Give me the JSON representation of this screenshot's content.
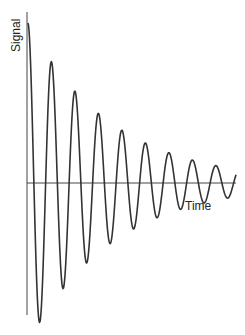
{
  "chart_data": {
    "type": "line",
    "title": "",
    "xlabel": "Time",
    "ylabel": "Signal",
    "grid": false,
    "legend": null,
    "series": [
      {
        "name": "Signal",
        "points_px_approx": [
          [
            28,
            22
          ],
          [
            37,
            312
          ],
          [
            50,
            65
          ],
          [
            61,
            273
          ],
          [
            74,
            95
          ],
          [
            84,
            251
          ],
          [
            97,
            120
          ],
          [
            108,
            230
          ],
          [
            120,
            136
          ],
          [
            132,
            217
          ],
          [
            143,
            149
          ],
          [
            155,
            209
          ],
          [
            167,
            158
          ],
          [
            179,
            202
          ],
          [
            190,
            169
          ],
          [
            203,
            194
          ],
          [
            214,
            171
          ],
          [
            228,
            193
          ],
          [
            236,
            183
          ]
        ]
      }
    ],
    "axes": {
      "y_axis_x": 27,
      "y_top": 12,
      "y_bottom": 315,
      "x_axis_y": 183,
      "x_left": 27,
      "x_right": 236
    },
    "model": {
      "x0": 28,
      "amplitude0": 160,
      "decay_per_px": 0.0118,
      "period_px": 23.5,
      "x_end": 236
    },
    "colors": {
      "line": "#333333",
      "axis": "#444444"
    }
  }
}
